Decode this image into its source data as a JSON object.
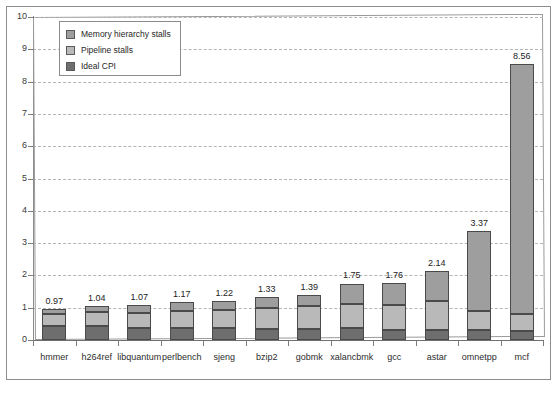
{
  "chart_data": {
    "type": "bar",
    "title": "",
    "subtitle": "",
    "xlabel": "",
    "ylabel": "",
    "stacked": true,
    "grid": true,
    "legend_position": "top-left",
    "ylim": [
      0,
      10
    ],
    "ytick_labels": [
      "0",
      "1",
      "2",
      "3",
      "4",
      "5",
      "6",
      "7",
      "8",
      "9",
      "10"
    ],
    "ytick_values": [
      0,
      1,
      2,
      3,
      4,
      5,
      6,
      7,
      8,
      9,
      10
    ],
    "categories": [
      "hmmer",
      "h264ref",
      "libquantum",
      "perlbench",
      "sjeng",
      "bzip2",
      "gobmk",
      "xalancbmk",
      "gcc",
      "astar",
      "omnetpp",
      "mcf"
    ],
    "series": [
      {
        "name": "Ideal CPI",
        "color": "#6e6e6e",
        "values": [
          0.42,
          0.44,
          0.37,
          0.36,
          0.38,
          0.34,
          0.33,
          0.36,
          0.3,
          0.3,
          0.32,
          0.28
        ]
      },
      {
        "name": "Pipeline stalls",
        "color": "#b9b9b9",
        "values": [
          0.38,
          0.42,
          0.48,
          0.55,
          0.54,
          0.66,
          0.73,
          0.74,
          0.77,
          0.9,
          0.58,
          0.52
        ]
      },
      {
        "name": "Memory hierarchy stalls",
        "color": "#9e9e9e",
        "values": [
          0.17,
          0.18,
          0.22,
          0.26,
          0.3,
          0.33,
          0.33,
          0.65,
          0.69,
          0.94,
          2.47,
          7.76
        ]
      }
    ],
    "totals": [
      0.97,
      1.04,
      1.07,
      1.17,
      1.22,
      1.33,
      1.39,
      1.75,
      1.76,
      2.14,
      3.37,
      8.56
    ],
    "total_labels": [
      "0.97",
      "1.04",
      "1.07",
      "1.17",
      "1.22",
      "1.33",
      "1.39",
      "1.75",
      "1.76",
      "2.14",
      "3.37",
      "8.56"
    ]
  },
  "legend": {
    "items": [
      {
        "label": "Memory hierarchy stalls",
        "swatch": "legend-swatch-memory"
      },
      {
        "label": "Pipeline stalls",
        "swatch": "legend-swatch-pipeline"
      },
      {
        "label": "Ideal CPI",
        "swatch": "legend-swatch-ideal"
      }
    ]
  }
}
